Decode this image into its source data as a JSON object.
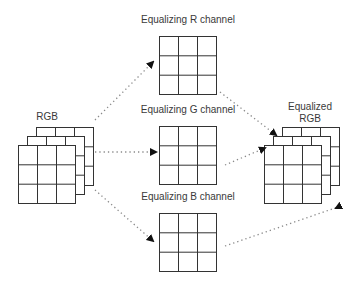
{
  "diagram": {
    "input_label": "RGB",
    "output_label_line1": "Equalized",
    "output_label_line2": "RGB",
    "channels": [
      {
        "label": "Equalizing R channel"
      },
      {
        "label": "Equalizing G channel"
      },
      {
        "label": "Equalizing B channel"
      }
    ],
    "colors": {
      "grid_stroke": "#333333",
      "arrow_dotted": "#888888",
      "text": "#3a3a3a"
    }
  }
}
